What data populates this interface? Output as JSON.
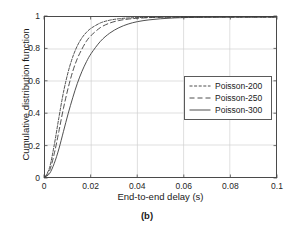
{
  "caption": "(b)",
  "chart_data": {
    "type": "line",
    "title": "",
    "xlabel": "End-to-end delay (s)",
    "ylabel": "Cumulative distribution function",
    "xlim": [
      0,
      0.1
    ],
    "ylim": [
      0,
      1
    ],
    "xticks": [
      "0",
      "0.02",
      "0.04",
      "0.06",
      "0.08",
      "0.1"
    ],
    "xtick_values": [
      0,
      0.02,
      0.04,
      0.06,
      0.08,
      0.1
    ],
    "yticks": [
      "0",
      "0.2",
      "0.4",
      "0.6",
      "0.8",
      "1"
    ],
    "ytick_values": [
      0,
      0.2,
      0.4,
      0.6,
      0.8,
      1
    ],
    "grid": true,
    "legend_position": "upper right",
    "x": [
      0,
      0.002,
      0.004,
      0.006,
      0.008,
      0.01,
      0.012,
      0.014,
      0.016,
      0.018,
      0.02,
      0.024,
      0.028,
      0.032,
      0.036,
      0.04,
      0.045,
      0.05,
      0.055,
      0.06,
      0.07,
      0.08,
      0.09,
      0.1
    ],
    "series": [
      {
        "name": "Poisson-200",
        "style": "dotted",
        "color": "#3a3a3a",
        "values": [
          0,
          0.06,
          0.2,
          0.37,
          0.53,
          0.655,
          0.75,
          0.82,
          0.87,
          0.905,
          0.93,
          0.963,
          0.98,
          0.989,
          0.994,
          0.9965,
          0.998,
          0.999,
          0.9995,
          0.9998,
          1,
          1,
          1,
          1
        ]
      },
      {
        "name": "Poisson-250",
        "style": "dashed",
        "color": "#3a3a3a",
        "values": [
          0,
          0.04,
          0.145,
          0.285,
          0.43,
          0.555,
          0.66,
          0.74,
          0.8,
          0.85,
          0.885,
          0.934,
          0.962,
          0.978,
          0.987,
          0.992,
          0.996,
          0.998,
          0.999,
          0.9995,
          0.9999,
          1,
          1,
          1
        ]
      },
      {
        "name": "Poisson-300",
        "style": "solid",
        "color": "#3a3a3a",
        "values": [
          0,
          0.022,
          0.085,
          0.175,
          0.285,
          0.395,
          0.495,
          0.585,
          0.66,
          0.722,
          0.772,
          0.848,
          0.899,
          0.933,
          0.956,
          0.971,
          0.982,
          0.989,
          0.9935,
          0.9962,
          0.9988,
          0.9997,
          0.9999,
          1
        ]
      }
    ]
  }
}
